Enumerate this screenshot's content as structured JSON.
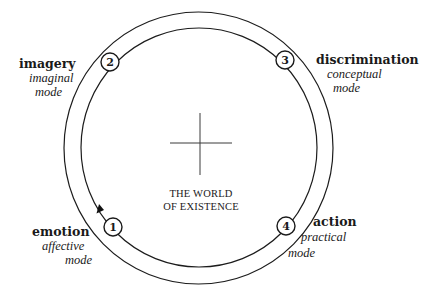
{
  "diagram": {
    "center": {
      "line1": "THE WORLD",
      "line2": "OF EXISTENCE"
    },
    "nodes": [
      {
        "number": "1",
        "title": "emotion",
        "subtitle": "affective",
        "mode": "mode"
      },
      {
        "number": "2",
        "title": "imagery",
        "subtitle": "imaginal",
        "mode": "mode"
      },
      {
        "number": "3",
        "title": "discrimination",
        "subtitle": "conceptual",
        "mode": "mode"
      },
      {
        "number": "4",
        "title": "action",
        "subtitle": "practical",
        "mode": "mode"
      }
    ],
    "colors": {
      "line": "#1c1c1c",
      "background": "#ffffff"
    }
  }
}
